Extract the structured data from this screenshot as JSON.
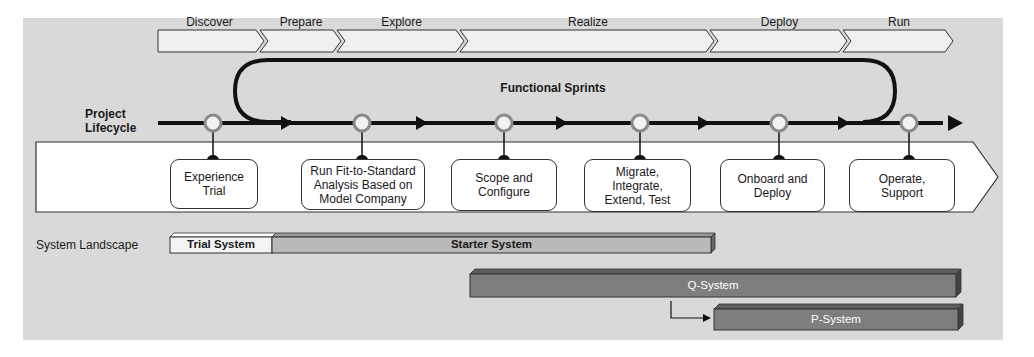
{
  "phases": [
    {
      "label": "Discover"
    },
    {
      "label": "Prepare"
    },
    {
      "label": "Explore"
    },
    {
      "label": "Realize"
    },
    {
      "label": "Deploy"
    },
    {
      "label": "Run"
    }
  ],
  "loop_label": "Functional Sprints",
  "lifecycle_label_line1": "Project",
  "lifecycle_label_line2": "Lifecycle",
  "tasks": [
    {
      "lines": [
        "Experience",
        "Trial"
      ]
    },
    {
      "lines": [
        "Run Fit-to-Standard",
        "Analysis Based on",
        "Model Company"
      ]
    },
    {
      "lines": [
        "Scope and",
        "Configure"
      ]
    },
    {
      "lines": [
        "Migrate,",
        "Integrate,",
        "Extend, Test"
      ]
    },
    {
      "lines": [
        "Onboard and",
        "Deploy"
      ]
    },
    {
      "lines": [
        "Operate,",
        "Support"
      ]
    }
  ],
  "landscape_label": "System Landscape",
  "systems": [
    {
      "label": "Trial System",
      "color": "#f4f4f4",
      "text_color": "#1a1a1a"
    },
    {
      "label": "Starter System",
      "color": "#b9b9b9",
      "text_color": "#1a1a1a"
    },
    {
      "label": "Q-System",
      "color": "#7e7e7e",
      "text_color": "#ffffff"
    },
    {
      "label": "P-System",
      "color": "#7e7e7e",
      "text_color": "#ffffff"
    }
  ],
  "colors": {
    "background": "#d9d9d9",
    "line": "#111111",
    "milestone_fill": "#f2f2f2",
    "milestone_stroke": "#8a8a8a"
  }
}
